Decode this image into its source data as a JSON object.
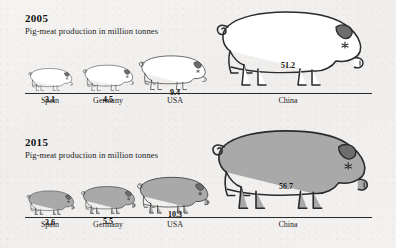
{
  "colors": {
    "background": "#f2f2f0",
    "ink": "#2a2a2a",
    "pig_fill_2005": "#ffffff",
    "pig_fill_2015": "#a9a9a9",
    "text": "#1a1a1a"
  },
  "chart_data": {
    "type": "bar",
    "title": "Pig-meat production in million tonnes",
    "xlabel": "",
    "ylabel": "million tonnes",
    "categories": [
      "Spain",
      "Germany",
      "USA",
      "China"
    ],
    "series": [
      {
        "name": "2005",
        "values": [
          3.1,
          4.5,
          9.4,
          51.2
        ]
      },
      {
        "name": "2015",
        "values": [
          3.6,
          5.5,
          10.3,
          56.7
        ]
      }
    ],
    "unit": "million tonnes",
    "note": "Pictorial chart: each value drawn as a pig silhouette scaled by production volume; 2005 pigs are white outlines, 2015 pigs are grey filled."
  },
  "panels": [
    {
      "year": "2005",
      "subtitle": "Pig-meat production in million tonnes",
      "filled": false,
      "items": [
        {
          "country": "Spain",
          "value": "3.1",
          "x": 50,
          "scale": 0.3,
          "vx": 50,
          "vy": 20
        },
        {
          "country": "Germany",
          "value": "4.5",
          "x": 108,
          "scale": 0.345,
          "vx": 108,
          "vy": 20
        },
        {
          "country": "USA",
          "value": "9.4",
          "x": 172,
          "scale": 0.46,
          "vx": 175,
          "vy": 27
        },
        {
          "country": "China",
          "value": "51.2",
          "x": 288,
          "scale": 1.0,
          "vx": 288,
          "vy": 54
        }
      ]
    },
    {
      "year": "2015",
      "subtitle": "Pig-meat production in million tonnes",
      "filled": true,
      "items": [
        {
          "country": "Spain",
          "value": "3.6",
          "x": 50,
          "scale": 0.325,
          "vx": 50,
          "vy": 21
        },
        {
          "country": "Germany",
          "value": "5.5",
          "x": 108,
          "scale": 0.37,
          "vx": 108,
          "vy": 22
        },
        {
          "country": "USA",
          "value": "10.3",
          "x": 172,
          "scale": 0.49,
          "vx": 175,
          "vy": 29
        },
        {
          "country": "China",
          "value": "56.7",
          "x": 288,
          "scale": 1.06,
          "vx": 286,
          "vy": 57
        }
      ]
    }
  ]
}
